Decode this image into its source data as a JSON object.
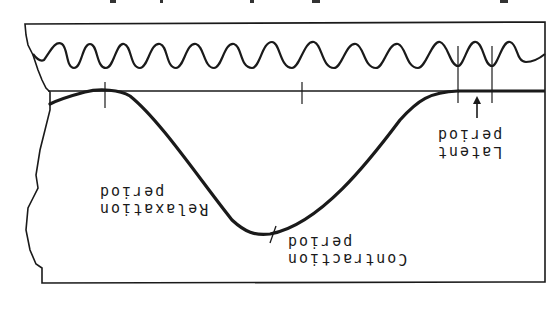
{
  "figure": {
    "orientation": "rotated 180 degrees",
    "colors": {
      "ink": "#1a1a1a",
      "paper": "#ffffff"
    }
  },
  "labels": {
    "latent": {
      "line1": "Latent",
      "line2": "period"
    },
    "contraction": {
      "line1": "Contraction",
      "line2": "period"
    },
    "relaxation": {
      "line1": "Relaxation",
      "line2": "period"
    }
  },
  "annotations": {
    "arrow": "arrow pointing to latent period interval"
  }
}
